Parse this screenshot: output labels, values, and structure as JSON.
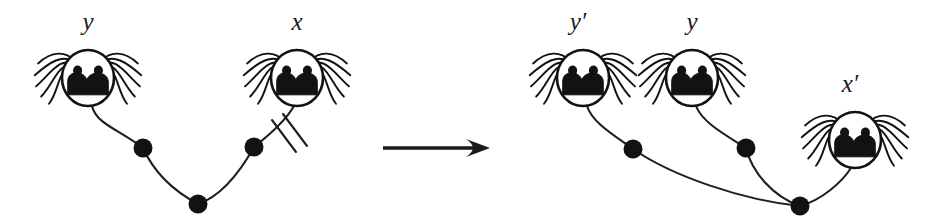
{
  "figure": {
    "background_color": "#ffffff",
    "ink_color": "#121212",
    "arrow": {
      "name": "rightwards-arrow",
      "x1": 383,
      "y1": 148,
      "x2": 490,
      "y2": 148
    },
    "left_panel": {
      "name": "before-graph",
      "faces": [
        {
          "id": "face-y-left",
          "label": "y",
          "prime": "",
          "cx": 88,
          "cy": 78,
          "rx": 26,
          "ry": 28,
          "label_x": 88,
          "label_y": 30,
          "whiskers": "both"
        },
        {
          "id": "face-x-left",
          "label": "x",
          "prime": "",
          "cx": 297,
          "cy": 78,
          "rx": 26,
          "ry": 28,
          "label_x": 297,
          "label_y": 30,
          "whiskers": "both"
        }
      ],
      "nodes": [
        {
          "id": "node-l1",
          "cx": 143,
          "cy": 148,
          "r": 9.5
        },
        {
          "id": "node-l2",
          "cx": 198,
          "cy": 204,
          "r": 9.5
        },
        {
          "id": "node-l3",
          "cx": 254,
          "cy": 147,
          "r": 9.5
        }
      ],
      "edges": [
        {
          "id": "edge-y-l1",
          "d": "M 92 106 C 96 124, 120 130, 143 148"
        },
        {
          "id": "edge-l1-l2",
          "d": "M 143 148 C 152 168, 168 188, 198 204"
        },
        {
          "id": "edge-l2-l3",
          "d": "M 198 204 C 222 196, 240 172, 254 147"
        },
        {
          "id": "edge-l3-x",
          "d": "M 254 147 C 268 136, 286 120, 294 106"
        }
      ],
      "slash_marks": [
        {
          "id": "slash-1",
          "x1": 272,
          "y1": 120,
          "x2": 296,
          "y2": 152
        },
        {
          "id": "slash-2",
          "x1": 283,
          "y1": 114,
          "x2": 307,
          "y2": 146
        }
      ]
    },
    "right_panel": {
      "name": "after-graph",
      "faces": [
        {
          "id": "face-yprime",
          "label": "y",
          "prime": "′",
          "cx": 583,
          "cy": 78,
          "rx": 26,
          "ry": 28,
          "label_x": 578,
          "label_y": 30,
          "whiskers": "both"
        },
        {
          "id": "face-y-right",
          "label": "y",
          "prime": "",
          "cx": 692,
          "cy": 78,
          "rx": 26,
          "ry": 28,
          "label_x": 692,
          "label_y": 30,
          "whiskers": "both"
        },
        {
          "id": "face-xprime",
          "label": "x",
          "prime": "′",
          "cx": 855,
          "cy": 140,
          "rx": 26,
          "ry": 28,
          "label_x": 850,
          "label_y": 92,
          "whiskers": "both"
        }
      ],
      "nodes": [
        {
          "id": "node-r1",
          "cx": 633,
          "cy": 149,
          "r": 9.5
        },
        {
          "id": "node-r2",
          "cx": 746,
          "cy": 148,
          "r": 9.5
        },
        {
          "id": "node-r3",
          "cx": 800,
          "cy": 206,
          "r": 9.5
        }
      ],
      "edges": [
        {
          "id": "edge-yprime-r1",
          "d": "M 587 106 C 592 122, 612 134, 633 149"
        },
        {
          "id": "edge-r1-r3",
          "d": "M 633 149 C 672 176, 742 200, 800 206"
        },
        {
          "id": "edge-y-r2",
          "d": "M 696 106 C 702 122, 724 134, 746 148"
        },
        {
          "id": "edge-r2-r3",
          "d": "M 746 148 C 752 172, 772 196, 800 206"
        },
        {
          "id": "edge-r3-xprime",
          "d": "M 800 206 C 822 200, 842 182, 851 168"
        }
      ]
    }
  }
}
